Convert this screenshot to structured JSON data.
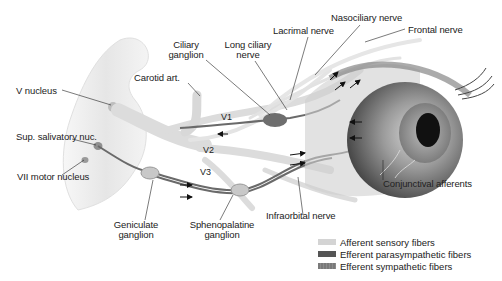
{
  "labels": {
    "v_nucleus": "V nucleus",
    "sup_salivatory": "Sup. salivatory nuc.",
    "vii_motor": "VII motor nucleus",
    "carotid": "Carotid art.",
    "ciliary_ganglion_1": "Ciliary",
    "ciliary_ganglion_2": "ganglion",
    "long_ciliary_1": "Long ciliary",
    "long_ciliary_2": "nerve",
    "lacrimal": "Lacrimal nerve",
    "nasociliary": "Nasociliary nerve",
    "frontal": "Frontal nerve",
    "v1": "V1",
    "v2": "V2",
    "v3": "V3",
    "geniculate_1": "Geniculate",
    "geniculate_2": "ganglion",
    "sphenopalatine_1": "Sphenopalatine",
    "sphenopalatine_2": "ganglion",
    "infraorbital": "Infraorbital nerve",
    "conjunctival": "Conjunctival afferents"
  },
  "legend": [
    {
      "label": "Afferent sensory fibers",
      "color": "#d4d4d4"
    },
    {
      "label": "Efferent parasympathetic fibers",
      "color": "#555555"
    },
    {
      "label": "Efferent sympathetic fibers",
      "color": "#7a7a7a"
    }
  ],
  "colors": {
    "afferent": "#d4d4d4",
    "parasympathetic": "#555555",
    "sympathetic": "#7a7a7a",
    "brainstem": "#ececec",
    "eye": "#6a6a6a"
  }
}
